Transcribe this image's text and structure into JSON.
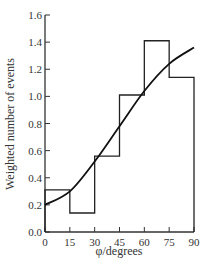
{
  "chart_data": {
    "type": "bar",
    "title": "",
    "xlabel": "φ/degrees",
    "ylabel": "Weighted number of events",
    "xlim": [
      0,
      90
    ],
    "ylim": [
      0,
      1.6
    ],
    "x_ticks": [
      "0",
      "15",
      "30",
      "45",
      "60",
      "75",
      "90"
    ],
    "y_ticks": [
      "0.0",
      "0.2",
      "0.4",
      "0.6",
      "0.8",
      "1.0",
      "1.2",
      "1.4",
      "1.6"
    ],
    "grid": false,
    "legend": null,
    "histogram": {
      "bin_edges": [
        0,
        15,
        30,
        45,
        60,
        75,
        90
      ],
      "values": [
        0.31,
        0.14,
        0.56,
        1.01,
        1.41,
        1.14
      ]
    },
    "fit_curve": {
      "x": [
        0,
        15,
        30,
        45,
        60,
        75,
        90
      ],
      "y": [
        0.2,
        0.3,
        0.52,
        0.78,
        1.04,
        1.24,
        1.36
      ]
    }
  }
}
